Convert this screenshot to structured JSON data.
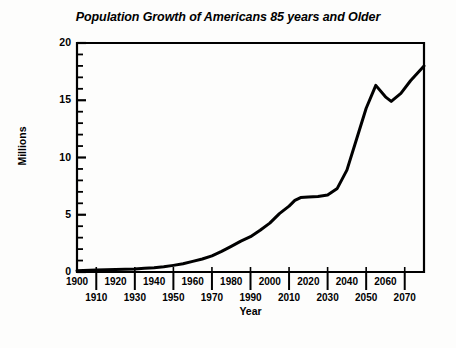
{
  "chart_data": {
    "type": "line",
    "title": "Population Growth of Americans 85 years and Older",
    "xlabel": "Year",
    "ylabel": "Millions",
    "xlim": [
      1900,
      2080
    ],
    "ylim": [
      0,
      20
    ],
    "grid": false,
    "legend": null,
    "y_ticks_major": [
      0,
      5,
      10,
      15,
      20
    ],
    "y_tick_minor_step": 1,
    "x_tick_labels_top": [
      "1900",
      "1920",
      "1940",
      "1960",
      "1980",
      "2000",
      "2020",
      "2040",
      "2060"
    ],
    "x_tick_labels_bottom": [
      "1910",
      "1930",
      "1950",
      "1970",
      "1990",
      "2010",
      "2030",
      "2050",
      "2070"
    ],
    "x": [
      1900,
      1910,
      1920,
      1930,
      1940,
      1950,
      1960,
      1970,
      1980,
      1990,
      2000,
      2010,
      2020,
      2030,
      2040,
      2050,
      2060,
      2070,
      2080
    ],
    "values": [
      0.12,
      0.17,
      0.21,
      0.27,
      0.37,
      0.58,
      0.93,
      1.41,
      2.24,
      3.08,
      4.27,
      5.75,
      6.55,
      6.7,
      7.3,
      8.9,
      10.9,
      13.4,
      16.3
    ],
    "series": [
      {
        "name": "Population 85+",
        "points": [
          [
            1900,
            0.12
          ],
          [
            1910,
            0.17
          ],
          [
            1920,
            0.21
          ],
          [
            1930,
            0.27
          ],
          [
            1935,
            0.32
          ],
          [
            1940,
            0.37
          ],
          [
            1945,
            0.45
          ],
          [
            1950,
            0.58
          ],
          [
            1955,
            0.72
          ],
          [
            1960,
            0.93
          ],
          [
            1965,
            1.14
          ],
          [
            1970,
            1.41
          ],
          [
            1975,
            1.8
          ],
          [
            1980,
            2.24
          ],
          [
            1985,
            2.7
          ],
          [
            1990,
            3.08
          ],
          [
            1995,
            3.65
          ],
          [
            2000,
            4.27
          ],
          [
            2005,
            5.1
          ],
          [
            2010,
            5.75
          ],
          [
            2013,
            6.25
          ],
          [
            2016,
            6.5
          ],
          [
            2020,
            6.55
          ],
          [
            2025,
            6.6
          ],
          [
            2030,
            6.72
          ],
          [
            2035,
            7.3
          ],
          [
            2040,
            8.9
          ],
          [
            2045,
            11.6
          ],
          [
            2050,
            14.3
          ],
          [
            2055,
            16.3
          ],
          [
            2060,
            15.3
          ],
          [
            2063,
            14.9
          ],
          [
            2068,
            15.6
          ],
          [
            2073,
            16.7
          ],
          [
            2080,
            18.0
          ]
        ]
      }
    ]
  }
}
